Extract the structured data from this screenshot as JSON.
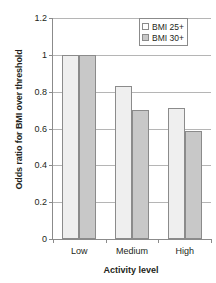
{
  "chart_data": {
    "type": "bar",
    "title": "",
    "xlabel": "Activity level",
    "ylabel": "Odds ratio for BMI over threshold",
    "categories": [
      "Low",
      "Medium",
      "High"
    ],
    "series": [
      {
        "name": "BMI 25+",
        "values": [
          1.0,
          0.83,
          0.71
        ],
        "color": "#efefef"
      },
      {
        "name": "BMI 30+",
        "values": [
          1.0,
          0.7,
          0.585
        ],
        "color": "#c8c8c8"
      }
    ],
    "ylim": [
      0,
      1.2
    ],
    "yticks": [
      0,
      0.2,
      0.4,
      0.6,
      0.8,
      1,
      1.2
    ],
    "ytick_labels": [
      "0",
      "0.2",
      "0.4",
      "0.6",
      "0.8",
      "1",
      "1.2"
    ],
    "grid": true,
    "legend_position": "top-right"
  },
  "legend": {
    "items": [
      {
        "label": "BMI 25+"
      },
      {
        "label": "BMI 30+"
      }
    ]
  }
}
